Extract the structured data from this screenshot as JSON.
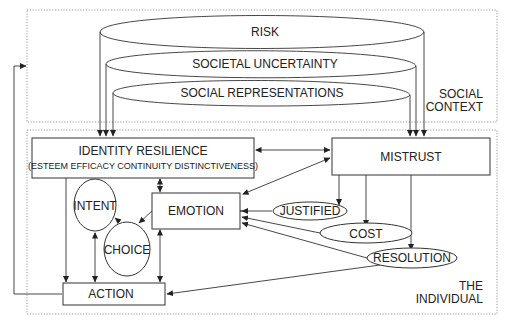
{
  "regions": {
    "social_context": {
      "label_line1": "SOCIAL",
      "label_line2": "CONTEXT"
    },
    "individual": {
      "label_line1": "THE",
      "label_line2": "INDIVIDUAL"
    }
  },
  "context_factors": [
    {
      "id": "risk",
      "label": "RISK"
    },
    {
      "id": "societal-uncertainty",
      "label": "SOCIETAL UNCERTAINTY"
    },
    {
      "id": "social-representations",
      "label": "SOCIAL REPRESENTATIONS"
    }
  ],
  "nodes": {
    "identity_resilience": {
      "title": "IDENTITY RESILIENCE",
      "subtitle": "(ESTEEM EFFICACY CONTINUITY DISTINCTIVENESS)"
    },
    "mistrust": {
      "label": "MISTRUST"
    },
    "emotion": {
      "label": "EMOTION"
    },
    "intent": {
      "label": "INTENT"
    },
    "choice": {
      "label": "CHOICE"
    },
    "action": {
      "label": "ACTION"
    },
    "justified": {
      "label": "JUSTIFIED"
    },
    "cost": {
      "label": "COST"
    },
    "resolution": {
      "label": "RESOLUTION"
    }
  },
  "edges": [
    {
      "from": "risk",
      "to": "identity_resilience"
    },
    {
      "from": "risk",
      "to": "mistrust"
    },
    {
      "from": "societal-uncertainty",
      "to": "identity_resilience"
    },
    {
      "from": "societal-uncertainty",
      "to": "mistrust"
    },
    {
      "from": "social-representations",
      "to": "identity_resilience"
    },
    {
      "from": "social-representations",
      "to": "mistrust"
    },
    {
      "from": "identity_resilience",
      "to": "mistrust",
      "bidirectional": true
    },
    {
      "from": "emotion",
      "to": "mistrust",
      "bidirectional": true
    },
    {
      "from": "identity_resilience",
      "to": "emotion",
      "bidirectional": true
    },
    {
      "from": "identity_resilience",
      "to": "action"
    },
    {
      "from": "intent",
      "to": "action",
      "bidirectional": true
    },
    {
      "from": "emotion",
      "to": "action",
      "bidirectional": true
    },
    {
      "from": "emotion",
      "to": "choice"
    },
    {
      "from": "choice",
      "to": "intent"
    },
    {
      "from": "mistrust",
      "to": "justified"
    },
    {
      "from": "mistrust",
      "to": "cost"
    },
    {
      "from": "mistrust",
      "to": "resolution"
    },
    {
      "from": "justified",
      "to": "emotion"
    },
    {
      "from": "cost",
      "to": "emotion"
    },
    {
      "from": "resolution",
      "to": "emotion"
    },
    {
      "from": "resolution",
      "to": "action"
    },
    {
      "from": "action",
      "to": "social_context"
    }
  ]
}
